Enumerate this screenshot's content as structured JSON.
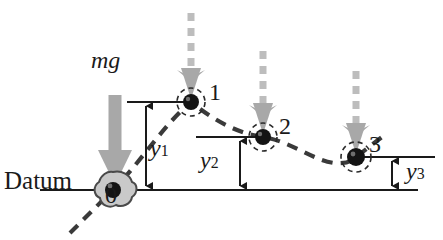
{
  "figure": {
    "title_text": "Datum",
    "force_label": "mg",
    "datum_label": "Datum",
    "colors": {
      "line": "#1a1a1a",
      "trajectory": "#3a3a3a",
      "gravity_arrow": "#a8a8a8",
      "ball": "#141414",
      "blob_fill": "#c9c9c9",
      "background": "#ffffff"
    },
    "positions": [
      {
        "id": "0",
        "label": "0",
        "x": 113,
        "y": 190,
        "kind": "blob"
      },
      {
        "id": "1",
        "label": "1",
        "x": 191,
        "y": 102,
        "kind": "ball"
      },
      {
        "id": "2",
        "label": "2",
        "x": 263,
        "y": 137,
        "kind": "ball"
      },
      {
        "id": "3",
        "label": "3",
        "x": 356,
        "y": 157,
        "kind": "ball"
      }
    ],
    "heights": [
      {
        "symbol": "y",
        "subscript": "1",
        "label": "y1",
        "from_y": 102,
        "to_y": 190,
        "x": 146
      },
      {
        "symbol": "y",
        "subscript": "2",
        "label": "y2",
        "from_y": 137,
        "to_y": 190,
        "x": 240
      },
      {
        "symbol": "y",
        "subscript": "3",
        "label": "y3",
        "from_y": 157,
        "to_y": 190,
        "x": 392
      }
    ],
    "gravity_arrows": [
      {
        "for_position": "0",
        "x": 115,
        "top_y": 95,
        "bottom_y": 184,
        "style": "solid",
        "width": 13
      },
      {
        "for_position": "1",
        "x": 191,
        "top_y": 12,
        "bottom_y": 98,
        "style": "dashed",
        "width": 7
      },
      {
        "for_position": "2",
        "x": 263,
        "top_y": 50,
        "bottom_y": 133,
        "style": "dashed",
        "width": 7
      },
      {
        "for_position": "3",
        "x": 356,
        "top_y": 70,
        "bottom_y": 153,
        "style": "dashed",
        "width": 7
      }
    ],
    "datum_line": {
      "x1": 40,
      "x2": 418,
      "y": 190
    },
    "leader_lines": [
      {
        "name": "leader-y1",
        "x1": 127,
        "x2": 191,
        "y": 102
      },
      {
        "name": "leader-y2",
        "x1": 196,
        "x2": 263,
        "y": 137
      },
      {
        "name": "leader-y3",
        "x1": 356,
        "x2": 435,
        "y": 157
      }
    ]
  }
}
